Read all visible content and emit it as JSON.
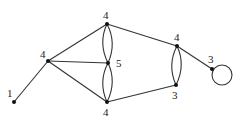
{
  "diagram": {
    "type": "undirected multigraph",
    "nodes": [
      {
        "id": "a",
        "degree_label": "1",
        "x": 14,
        "y": 102
      },
      {
        "id": "b",
        "degree_label": "4",
        "x": 48,
        "y": 61
      },
      {
        "id": "c",
        "degree_label": "4",
        "x": 107,
        "y": 24
      },
      {
        "id": "d",
        "degree_label": "5",
        "x": 108,
        "y": 63
      },
      {
        "id": "e",
        "degree_label": "4",
        "x": 107,
        "y": 102
      },
      {
        "id": "f",
        "degree_label": "4",
        "x": 177,
        "y": 46
      },
      {
        "id": "g",
        "degree_label": "3",
        "x": 176,
        "y": 85
      },
      {
        "id": "h",
        "degree_label": "3",
        "x": 212,
        "y": 69
      }
    ],
    "edges": [
      [
        "a",
        "b"
      ],
      [
        "b",
        "c"
      ],
      [
        "b",
        "d"
      ],
      [
        "b",
        "e"
      ],
      [
        "c",
        "d"
      ],
      [
        "c",
        "d"
      ],
      [
        "d",
        "e"
      ],
      [
        "d",
        "e"
      ],
      [
        "c",
        "f"
      ],
      [
        "e",
        "g"
      ],
      [
        "f",
        "g"
      ],
      [
        "f",
        "g"
      ],
      [
        "f",
        "h"
      ],
      [
        "h",
        "h"
      ]
    ]
  }
}
